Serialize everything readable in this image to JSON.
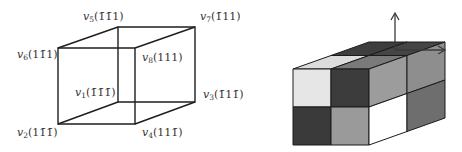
{
  "wireframe_cube": {
    "vertices": [
      {
        "id": "v1",
        "name": "v",
        "sub": "1",
        "coords": "(1̄1̄1̄)",
        "role": "back-bottom-left"
      },
      {
        "id": "v2",
        "name": "v",
        "sub": "2",
        "coords": "(11̄1̄)",
        "role": "front-bottom-left"
      },
      {
        "id": "v3",
        "name": "v",
        "sub": "3",
        "coords": "(1̄11̄)",
        "role": "back-bottom-right"
      },
      {
        "id": "v4",
        "name": "v",
        "sub": "4",
        "coords": "(111̄)",
        "role": "front-bottom-right"
      },
      {
        "id": "v5",
        "name": "v",
        "sub": "5",
        "coords": "(1̄1̄1)",
        "role": "back-top-left"
      },
      {
        "id": "v6",
        "name": "v",
        "sub": "6",
        "coords": "(11̄1)",
        "role": "front-top-left"
      },
      {
        "id": "v7",
        "name": "v",
        "sub": "7",
        "coords": "(1̄11)",
        "role": "back-top-right"
      },
      {
        "id": "v8",
        "name": "v",
        "sub": "8",
        "coords": "(111)",
        "role": "front-top-right"
      }
    ],
    "edge_color": "#1e1e1e"
  },
  "block_cube": {
    "front_face": [
      [
        "#e6e6e6",
        "#3c3c3c"
      ],
      [
        "#3a3a3a",
        "#9a9a9a"
      ]
    ],
    "side_face": [
      [
        "#9c9c9c",
        "#8e8e8e"
      ],
      [
        "#ffffff",
        "#6e6e6e"
      ]
    ],
    "top_face": [
      [
        "#3e3e3e",
        "#454545"
      ],
      [
        "#dcdcdc",
        "#7a7a7a"
      ]
    ],
    "axes": [
      "up-arrow",
      "right-arrow"
    ],
    "axis_color": "#3a3a3a"
  }
}
